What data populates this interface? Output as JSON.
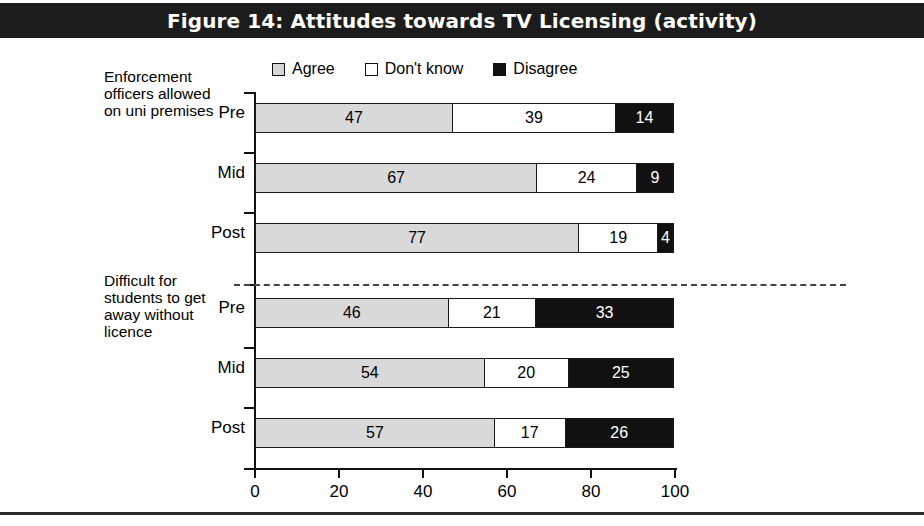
{
  "figure": {
    "title": "Figure 14: Attitudes towards TV Licensing (activity)"
  },
  "legend": {
    "items": [
      {
        "label": "Agree",
        "swatch": "light-gray",
        "color": "#d9d9d9"
      },
      {
        "label": "Don't know",
        "swatch": "white",
        "color": "#ffffff"
      },
      {
        "label": "Disagree",
        "swatch": "black",
        "color": "#111111"
      }
    ]
  },
  "groups": [
    {
      "label": "Enforcement officers allowed on uni premises"
    },
    {
      "label": "Difficult for students to get away without licence"
    }
  ],
  "row_labels": [
    "Pre",
    "Mid",
    "Post",
    "Pre",
    "Mid",
    "Post"
  ],
  "axis": {
    "x_ticks": [
      "0",
      "20",
      "40",
      "60",
      "80",
      "100"
    ]
  },
  "chart_data": {
    "type": "bar",
    "orientation": "horizontal",
    "stacked": true,
    "percent": true,
    "title": "Figure 14: Attitudes towards TV Licensing (activity)",
    "xlabel": "",
    "ylabel": "",
    "xlim": [
      0,
      100
    ],
    "xticks": [
      0,
      20,
      40,
      60,
      80,
      100
    ],
    "grid": false,
    "legend_position": "top",
    "group_labels": [
      "Enforcement officers allowed on uni premises",
      "Difficult for students to get away without licence"
    ],
    "categories": [
      "Pre",
      "Mid",
      "Post",
      "Pre",
      "Mid",
      "Post"
    ],
    "series": [
      {
        "name": "Agree",
        "color": "#d9d9d9",
        "values": [
          47,
          67,
          77,
          46,
          54,
          57
        ]
      },
      {
        "name": "Don't know",
        "color": "#ffffff",
        "values": [
          39,
          24,
          19,
          21,
          20,
          17
        ]
      },
      {
        "name": "Disagree",
        "color": "#111111",
        "values": [
          14,
          9,
          4,
          33,
          25,
          26
        ]
      }
    ],
    "rows": [
      {
        "group": "Enforcement officers allowed on uni premises",
        "category": "Pre",
        "Agree": 47,
        "Dont know": 39,
        "Disagree": 14
      },
      {
        "group": "Enforcement officers allowed on uni premises",
        "category": "Mid",
        "Agree": 67,
        "Dont know": 24,
        "Disagree": 9
      },
      {
        "group": "Enforcement officers allowed on uni premises",
        "category": "Post",
        "Agree": 77,
        "Dont know": 19,
        "Disagree": 4
      },
      {
        "group": "Difficult for students to get away without licence",
        "category": "Pre",
        "Agree": 46,
        "Dont know": 21,
        "Disagree": 33
      },
      {
        "group": "Difficult for students to get away without licence",
        "category": "Mid",
        "Agree": 54,
        "Dont know": 20,
        "Disagree": 25
      },
      {
        "group": "Difficult for students to get away without licence",
        "category": "Post",
        "Agree": 57,
        "Dont know": 17,
        "Disagree": 26
      }
    ]
  }
}
